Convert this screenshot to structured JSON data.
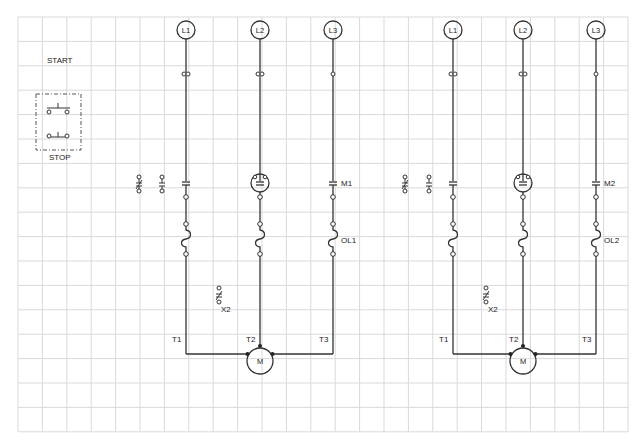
{
  "diagram": {
    "colors": {
      "grid": "#d9d9d9",
      "ink": "#333333",
      "background": "#ffffff"
    },
    "grid": {
      "x0": 18,
      "y0": 17,
      "cols": 25,
      "rows": 17,
      "cell": 24.4
    },
    "pushbutton_station": {
      "start_label": "START",
      "stop_label": "STOP"
    },
    "circuits": [
      {
        "id": "circuit-1",
        "lines": [
          {
            "label": "L1",
            "x": 186,
            "fuse": "double",
            "contact": "mc",
            "overload": true
          },
          {
            "label": "L2",
            "x": 260,
            "fuse": "double",
            "contact": "mc-pilot",
            "overload": true
          },
          {
            "label": "L3",
            "x": 333,
            "fuse": "single",
            "contact": "mc",
            "overload": true
          }
        ],
        "contactor_label": "M1",
        "overload_label": "OL1",
        "aux_contacts": [
          {
            "type": "nc",
            "x": 139,
            "y": 185
          },
          {
            "type": "no",
            "x": 162,
            "y": 185
          }
        ],
        "x2_contact": {
          "label": "X2",
          "x": 219,
          "y": 296
        },
        "terminals": [
          "T1",
          "T2",
          "T3"
        ],
        "motor_label": "M",
        "motor_x": 260
      },
      {
        "id": "circuit-2",
        "lines": [
          {
            "label": "L1",
            "x": 453,
            "fuse": "double",
            "contact": "mc",
            "overload": true
          },
          {
            "label": "L2",
            "x": 523,
            "fuse": "double",
            "contact": "mc-pilot",
            "overload": true
          },
          {
            "label": "L3",
            "x": 596,
            "fuse": "single",
            "contact": "mc",
            "overload": true
          }
        ],
        "contactor_label": "M2",
        "overload_label": "OL2",
        "aux_contacts": [
          {
            "type": "nc",
            "x": 405,
            "y": 185
          },
          {
            "type": "no",
            "x": 429,
            "y": 185
          }
        ],
        "x2_contact": {
          "label": "X2",
          "x": 486,
          "y": 296
        },
        "terminals": [
          "T1",
          "T2",
          "T3"
        ],
        "motor_label": "M",
        "motor_x": 523
      }
    ]
  }
}
